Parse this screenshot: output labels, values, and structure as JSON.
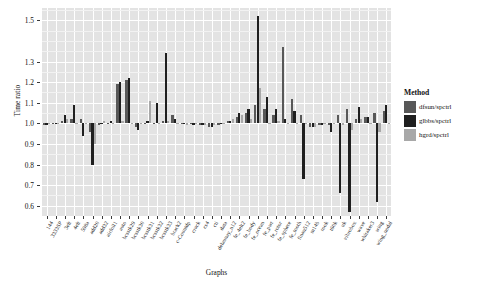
{
  "chart_data": {
    "type": "bar",
    "title": "",
    "xlabel": "Graphs",
    "ylabel": "Time ratio",
    "ylim": [
      0.55,
      1.56
    ],
    "baseline": 1.0,
    "grid": true,
    "legend_position": "right",
    "legend_title": "Method",
    "yticks": [
      0.6,
      0.7,
      0.8,
      0.9,
      1.0,
      1.1,
      1.2,
      1.3,
      1.5
    ],
    "ytick_labels": [
      "0.6",
      "0.7",
      "0.8",
      "0.9",
      "1.0",
      "1.1",
      "1.2",
      "1.3",
      "1.5"
    ],
    "colors": {
      "dfsun/spctrl": "#585858",
      "glbbs/spctrl": "#1f1f1f",
      "hgrd/spctrl": "#a8a8a8",
      "panel_bg": "#e3e3e3",
      "grid_major": "#ffffff",
      "grid_minor": "#f2f2f2"
    },
    "categories": [
      "144",
      "3333SP",
      "3elt",
      "4elt",
      "598a",
      "add20",
      "add32",
      "airfoil1",
      "auto",
      "bcsstk29",
      "bcsstk30",
      "bcsstk31",
      "bcsstk32",
      "bcsstk33",
      "brack2",
      "c-Countdp",
      "crack",
      "cs4",
      "cti",
      "data",
      "delaunay_n12",
      "fe_4elt2",
      "fe_body",
      "fe_ocean",
      "fe_pwt",
      "fe_rotor",
      "fe_sphere",
      "fe_tooth",
      "finan512",
      "m14b",
      "rook",
      "t60k",
      "uk",
      "vibrobox",
      "wave",
      "whitaker3",
      "wing",
      "wing_nodal"
    ],
    "series": [
      {
        "name": "dfsun/spctrl",
        "color": "#585858",
        "values": [
          0.99,
          1.0,
          1.01,
          1.02,
          1.02,
          0.96,
          0.99,
          1.0,
          1.19,
          1.21,
          0.98,
          1.0,
          1.0,
          1.01,
          1.04,
          1.0,
          1.0,
          0.99,
          0.98,
          0.99,
          1.01,
          1.03,
          1.05,
          1.09,
          1.07,
          1.04,
          1.37,
          1.12,
          1.04,
          0.98,
          0.99,
          0.99,
          1.04,
          1.07,
          1.02,
          1.03,
          1.05,
          1.06
        ]
      },
      {
        "name": "glbbs/spctrl",
        "color": "#1f1f1f",
        "values": [
          0.99,
          1.0,
          1.04,
          1.09,
          0.94,
          0.8,
          1.0,
          1.01,
          1.2,
          1.22,
          0.97,
          1.01,
          1.1,
          1.34,
          1.02,
          1.0,
          0.99,
          0.99,
          0.98,
          1.0,
          1.01,
          1.05,
          1.07,
          1.52,
          1.13,
          1.07,
          1.02,
          1.06,
          0.73,
          0.98,
          0.99,
          0.96,
          0.66,
          0.57,
          1.08,
          1.03,
          0.62,
          1.09
        ]
      },
      {
        "name": "hgrd/spctrl",
        "color": "#a8a8a8",
        "values": [
          1.0,
          1.0,
          1.02,
          1.0,
          1.0,
          0.9,
          1.01,
          1.0,
          1.01,
          1.0,
          1.0,
          1.11,
          1.0,
          1.01,
          1.0,
          0.99,
          1.0,
          0.99,
          0.99,
          1.0,
          1.02,
          1.04,
          1.02,
          1.17,
          1.0,
          1.01,
          1.0,
          1.0,
          1.0,
          0.98,
          1.0,
          1.0,
          0.99,
          0.97,
          1.02,
          1.0,
          0.96,
          1.0
        ]
      }
    ],
    "legend_entries": [
      {
        "label": "dfsun/spctrl",
        "color": "#585858"
      },
      {
        "label": "glbbs/spctrl",
        "color": "#1f1f1f"
      },
      {
        "label": "hgrd/spctrl",
        "color": "#a8a8a8"
      }
    ]
  }
}
